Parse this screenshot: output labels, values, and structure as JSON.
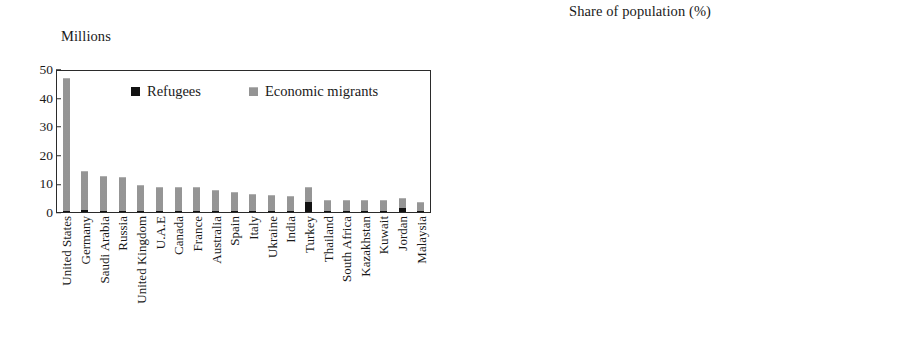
{
  "figure": {
    "kind": "two-panel-stacked-bar-figure",
    "background_color": "#ffffff",
    "colors": {
      "refugees": "#121212",
      "economic_migrants": "#9a9a9a",
      "axis": "#2b2b2b",
      "text": "#1a1a1a"
    }
  },
  "legend": {
    "refugees_label": "Refugees",
    "economic_migrants_label": "Economic migrants",
    "refugees_swatch": "black-square-icon",
    "economic_migrants_swatch": "gray-square-icon",
    "position": "inside-top-center"
  },
  "chart_data": [
    {
      "panel": "left",
      "type": "bar",
      "stacked": true,
      "title": "Millions",
      "xlabel": "",
      "ylabel": "Millions",
      "ylim": [
        0,
        50
      ],
      "yticks": [
        0,
        10,
        20,
        30,
        40,
        50
      ],
      "ytick_labels": [
        "0",
        "10",
        "20",
        "30",
        "40",
        "50"
      ],
      "grid": false,
      "legend_entries": [
        "Refugees",
        "Economic migrants"
      ],
      "categories": [
        "United States",
        "Germany",
        "Saudi Arabia",
        "Russia",
        "United Kingdom",
        "U.A.E",
        "Canada",
        "France",
        "Australia",
        "Spain",
        "Italy",
        "Ukraine",
        "India",
        "Turkey",
        "Thailand",
        "South Africa",
        "Kazakhstan",
        "Kuwait",
        "Jordan",
        "Malaysia"
      ],
      "series": [
        {
          "name": "Refugees",
          "color": "#121212",
          "values": [
            0.3,
            0.6,
            0.1,
            0.3,
            0.1,
            0.0,
            0.1,
            0.3,
            0.0,
            0.0,
            0.1,
            0.0,
            0.2,
            3.5,
            0.1,
            0.1,
            0.0,
            0.0,
            1.4,
            0.1
          ]
        },
        {
          "name": "Economic migrants",
          "color": "#9a9a9a",
          "values": [
            47.2,
            13.9,
            12.4,
            12.2,
            9.4,
            8.5,
            8.7,
            8.5,
            7.7,
            6.9,
            6.0,
            5.6,
            5.4,
            5.5,
            4.1,
            4.1,
            4.0,
            3.9,
            3.4,
            3.4
          ]
        }
      ],
      "totals": [
        47.5,
        14.5,
        12.5,
        12.5,
        9.5,
        8.5,
        8.8,
        8.8,
        7.7,
        6.9,
        6.1,
        5.6,
        5.6,
        9.0,
        4.2,
        4.2,
        4.0,
        3.9,
        4.8,
        3.5
      ]
    },
    {
      "panel": "right",
      "type": "bar",
      "stacked": true,
      "title": "Share of population (%)",
      "xlabel": "",
      "ylabel": "Share of population (%)",
      "ylim": [
        0,
        100
      ],
      "yticks": [
        0,
        10,
        20,
        30,
        40,
        50,
        60,
        70,
        80,
        90,
        100
      ],
      "ytick_labels": [
        "0",
        "10",
        "20",
        "30",
        "40",
        "50",
        "60",
        "70",
        "80",
        "90",
        "100"
      ],
      "grid": false,
      "legend_entries": [
        "Refugees",
        "Economic migrants"
      ],
      "categories": [
        "U.A.E.",
        "Kuwait",
        "Qatar",
        "Bahrain",
        "Singapore",
        "Oman",
        "Hong Kong SAR",
        "Saudi Arabia",
        "Jordan",
        "Switzerland",
        "New Zealand",
        "Australia",
        "Israel",
        "Canada",
        "Kazakhstan",
        "Gabon",
        "Slovenia",
        "Austria",
        "Ireland",
        "Equatorial Guinea"
      ],
      "series": [
        {
          "name": "Refugees",
          "color": "#121212",
          "values": [
            0.2,
            0.3,
            0.1,
            0.2,
            0.1,
            0.1,
            0.6,
            0.3,
            8.2,
            2.0,
            0.5,
            0.5,
            0.4,
            0.5,
            0.4,
            0.2,
            0.2,
            2.4,
            0.3,
            0.2
          ]
        },
        {
          "name": "Economic migrants",
          "color": "#9a9a9a",
          "values": [
            88.3,
            80.7,
            79.9,
            55.3,
            45.4,
            44.4,
            37.9,
            36.7,
            33.8,
            30.5,
            28.2,
            27.5,
            23.9,
            22.0,
            20.4,
            18.8,
            18.0,
            18.1,
            17.7,
            17.8
          ]
        }
      ],
      "totals": [
        88.5,
        81.0,
        80.0,
        55.5,
        45.5,
        44.5,
        38.5,
        37.0,
        42.0,
        32.5,
        28.7,
        28.0,
        24.3,
        22.5,
        20.8,
        19.0,
        18.2,
        20.5,
        18.0,
        18.0
      ]
    }
  ]
}
